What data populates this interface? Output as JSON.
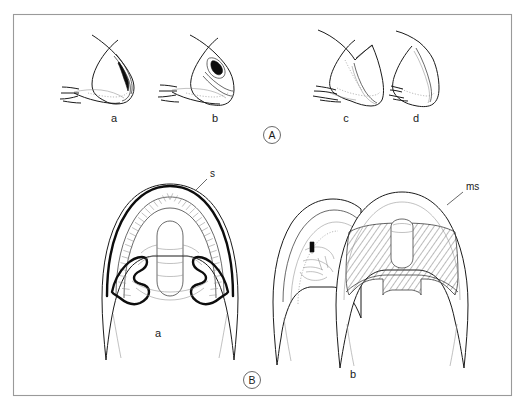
{
  "figure": {
    "type": "scientific-line-drawing",
    "background_color": "#ffffff",
    "ink_color": "#1b1b1b",
    "frame_color": "#9a9a9a",
    "panels": [
      {
        "id": "A",
        "letter": "A",
        "letter_circled": true,
        "description": "Row of four lateral-view outline drawings of carapace/head profiles",
        "items": [
          {
            "label": "a"
          },
          {
            "label": "b"
          },
          {
            "label": "c"
          },
          {
            "label": "d"
          }
        ]
      },
      {
        "id": "B",
        "letter": "B",
        "letter_circled": true,
        "description": "Two anterior-view outline drawings of horned structures",
        "items": [
          {
            "label": "a"
          },
          {
            "label": "b"
          }
        ],
        "annotations": [
          {
            "label": "s",
            "target": "outer spine margin of B-a"
          },
          {
            "label": "ms",
            "target": "outer margin of B-b"
          }
        ]
      }
    ]
  },
  "labels": {
    "row_a": {
      "a": "a",
      "b": "b",
      "c": "c",
      "d": "d"
    },
    "row_b": {
      "a": "a",
      "b": "b"
    },
    "panel_a_letter": "A",
    "panel_b_letter": "B",
    "leader_s": "s",
    "leader_ms": "ms"
  }
}
